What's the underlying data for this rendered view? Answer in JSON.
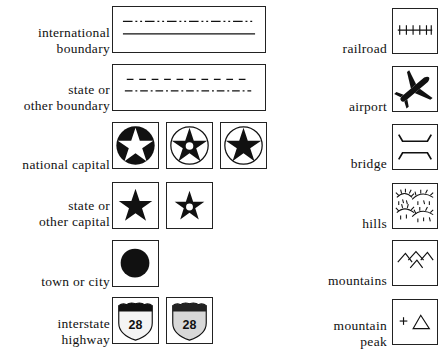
{
  "legend": {
    "left": [
      {
        "id": "international-boundary",
        "label_lines": [
          "international",
          "boundary"
        ]
      },
      {
        "id": "state-boundary",
        "label_lines": [
          "state or",
          "other boundary"
        ]
      },
      {
        "id": "national-capital",
        "label_lines": [
          "national capital"
        ]
      },
      {
        "id": "state-capital",
        "label_lines": [
          "state or",
          "other capital"
        ]
      },
      {
        "id": "town-or-city",
        "label_lines": [
          "town or city"
        ]
      },
      {
        "id": "interstate-highway",
        "label_lines": [
          "interstate",
          "highway"
        ],
        "shield_number": "28"
      }
    ],
    "right": [
      {
        "id": "railroad",
        "label_lines": [
          "railroad"
        ]
      },
      {
        "id": "airport",
        "label_lines": [
          "airport"
        ]
      },
      {
        "id": "bridge",
        "label_lines": [
          "bridge"
        ]
      },
      {
        "id": "hills",
        "label_lines": [
          "hills"
        ]
      },
      {
        "id": "mountains",
        "label_lines": [
          "mountains"
        ]
      },
      {
        "id": "mountain-peak",
        "label_lines": [
          "mountain",
          "peak"
        ]
      }
    ]
  },
  "icons": {
    "international_boundary": "dash-dot-line-and-solid-line",
    "state_boundary": "dashed-line-and-dash-dot-line",
    "national_capital": [
      "star-in-filled-circle",
      "star-with-dot-in-circle",
      "star-in-circle"
    ],
    "state_capital": [
      "filled-star",
      "star-with-dot"
    ],
    "town": "filled-circle",
    "interstate": [
      "shield-white",
      "shield-gray"
    ],
    "railroad": "track-line",
    "airport": "airplane",
    "bridge": "bridge-lines",
    "hills": "hachure-hills",
    "mountains": "chevron-peaks",
    "mountain_peak": "plus-and-triangle"
  },
  "colors": {
    "ink": "#111111",
    "shield_gray": "#d8d8d8",
    "shield_white": "#f4f4f4"
  }
}
